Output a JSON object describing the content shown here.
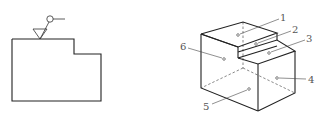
{
  "figure": {
    "left_view": {
      "description": "front view outline with surface texture symbol",
      "symbol": "surface-finish-symbol"
    },
    "right_view": {
      "description": "isometric view of stepped block with numbered surfaces",
      "labels": [
        {
          "id": "1",
          "text": "1"
        },
        {
          "id": "2",
          "text": "2"
        },
        {
          "id": "3",
          "text": "3"
        },
        {
          "id": "4",
          "text": "4"
        },
        {
          "id": "5",
          "text": "5"
        },
        {
          "id": "6",
          "text": "6"
        }
      ]
    }
  }
}
